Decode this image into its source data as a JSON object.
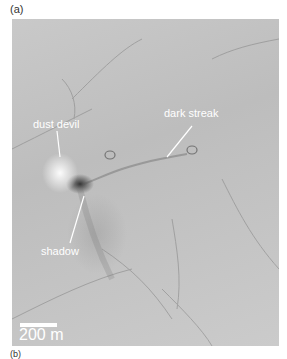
{
  "figure": {
    "panel_a_label": "(a)",
    "panel_b_label": "(b)",
    "annotations": {
      "dust_devil": "dust devil",
      "dark_streak": "dark streak",
      "shadow": "shadow"
    },
    "scale_bar": "200 m"
  }
}
